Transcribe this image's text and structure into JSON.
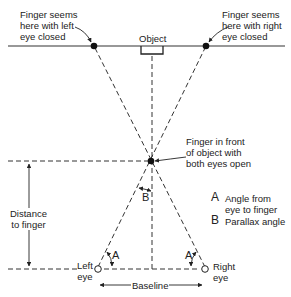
{
  "labels": {
    "left_closed": [
      "Finger seems",
      "here with left",
      "eye closed"
    ],
    "right_closed": [
      "Finger seems",
      "here with right",
      "eye closed"
    ],
    "object": "Object",
    "finger_front": [
      "Finger in front",
      "of object with",
      "both eyes open"
    ],
    "distance": [
      "Distance",
      "to finger"
    ],
    "left_eye": [
      "Left",
      "eye"
    ],
    "right_eye": [
      "Right",
      "eye"
    ],
    "baseline": "Baseline",
    "angle_a": "A",
    "angle_b": "B"
  },
  "legend": [
    {
      "key": "A",
      "lines": [
        "Angle from",
        "eye to finger"
      ]
    },
    {
      "key": "B",
      "lines": [
        "Parallax angle"
      ]
    }
  ]
}
